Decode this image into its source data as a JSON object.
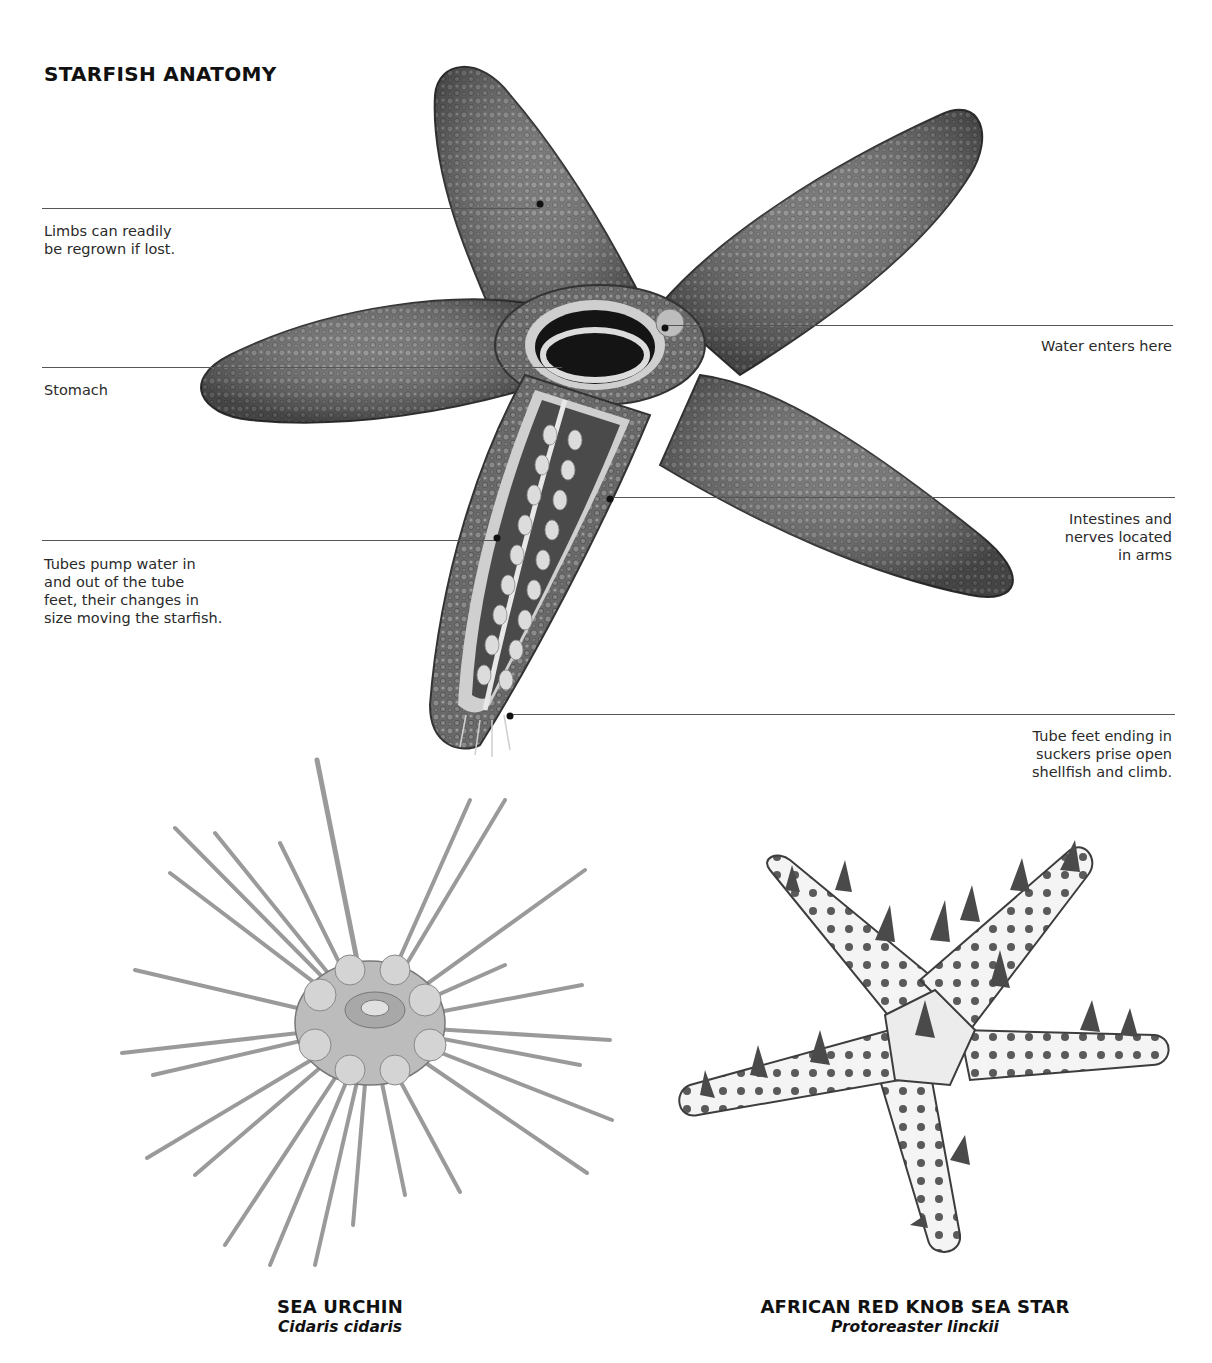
{
  "diagram": {
    "title": "STARFISH ANATOMY",
    "labels": [
      {
        "id": "limbs",
        "text_lines": [
          "Limbs can readily",
          "be regrown if lost."
        ],
        "side": "left"
      },
      {
        "id": "stomach",
        "text_lines": [
          "Stomach"
        ],
        "side": "left"
      },
      {
        "id": "tubes",
        "text_lines": [
          "Tubes pump water in",
          "and out of the tube",
          "feet, their changes in",
          "size moving the starfish."
        ],
        "side": "left"
      },
      {
        "id": "water",
        "text_lines": [
          "Water enters here"
        ],
        "side": "right"
      },
      {
        "id": "intestines",
        "text_lines": [
          "Intestines and",
          "nerves located",
          "in arms"
        ],
        "side": "right"
      },
      {
        "id": "tube-feet",
        "text_lines": [
          "Tube feet ending in",
          "suckers prise open",
          "shellfish and climb."
        ],
        "side": "right"
      }
    ]
  },
  "specimens": [
    {
      "common_name": "SEA URCHIN",
      "latin_name": "Cidaris cidaris"
    },
    {
      "common_name": "AFRICAN RED KNOB SEA STAR",
      "latin_name": "Protoreaster linckii"
    }
  ],
  "colors": {
    "background": "#ffffff",
    "text": "#1a1a1a",
    "leader_line": "#555555",
    "starfish_body": "#6e6e6e",
    "starfish_dark": "#3a3a3a",
    "tube_feet": "#d8d8d8"
  }
}
